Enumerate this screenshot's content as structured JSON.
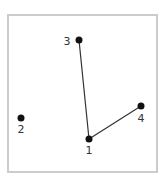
{
  "diagram": {
    "type": "graph",
    "frame_color": "#cccccc",
    "node_color": "#111111",
    "edge_color": "#333333",
    "nodes": [
      {
        "id": "1",
        "label": "1",
        "x": 89,
        "y": 139,
        "lx": 89,
        "ly": 154
      },
      {
        "id": "2",
        "label": "2",
        "x": 21,
        "y": 118,
        "lx": 21,
        "ly": 133
      },
      {
        "id": "3",
        "label": "3",
        "x": 79,
        "y": 40,
        "lx": 67,
        "ly": 45
      },
      {
        "id": "4",
        "label": "4",
        "x": 141,
        "y": 106,
        "lx": 141,
        "ly": 122
      }
    ],
    "edges": [
      {
        "from": "1",
        "to": "3"
      },
      {
        "from": "1",
        "to": "4"
      }
    ]
  }
}
